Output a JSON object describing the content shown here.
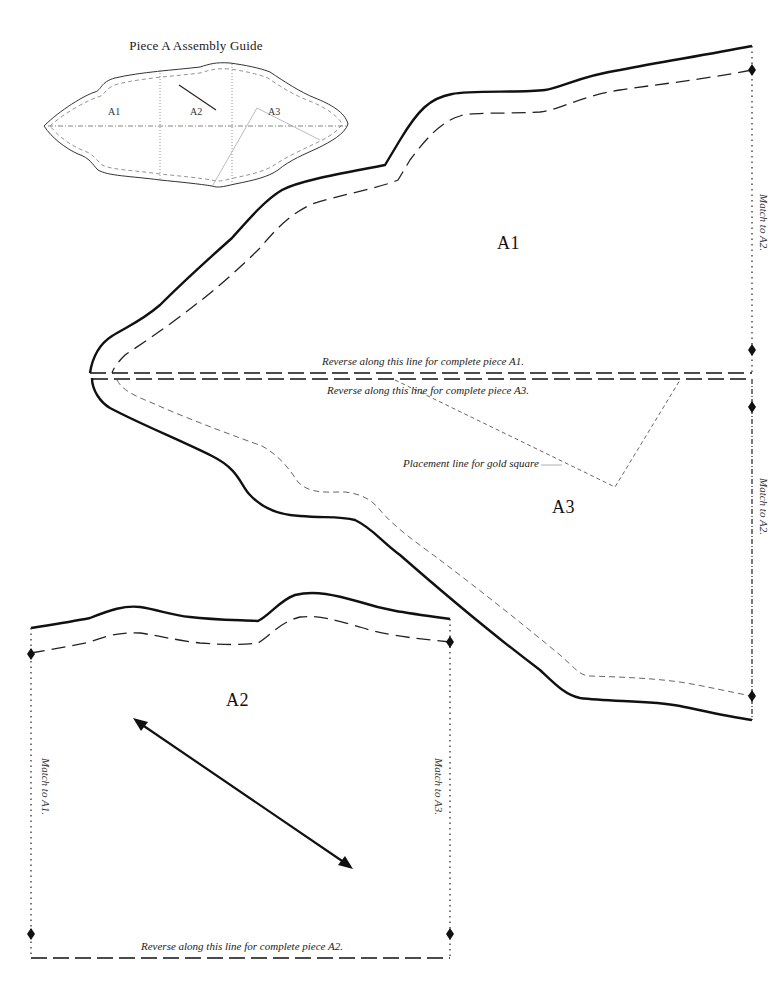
{
  "guide": {
    "title": "Piece A Assembly Guide",
    "labels": {
      "a1": "A1",
      "a2": "A2",
      "a3": "A3"
    }
  },
  "pieces": {
    "a1": {
      "label": "A1",
      "reverse_note": "Reverse along this line for complete piece A1.",
      "match_note": "Match to A2."
    },
    "a3": {
      "label": "A3",
      "reverse_note": "Reverse along this line for complete piece A3.",
      "match_note": "Match to A2.",
      "placement_note": "Placement line for gold square"
    },
    "a2": {
      "label": "A2",
      "reverse_note": "Reverse along this line for complete piece A2.",
      "match_left_note": "Match to A1.",
      "match_right_note": "Match to A3."
    }
  },
  "colors": {
    "cut_line": "#111111",
    "seam_line": "#222222",
    "guide_line": "#555555",
    "placement_line": "#555555"
  }
}
